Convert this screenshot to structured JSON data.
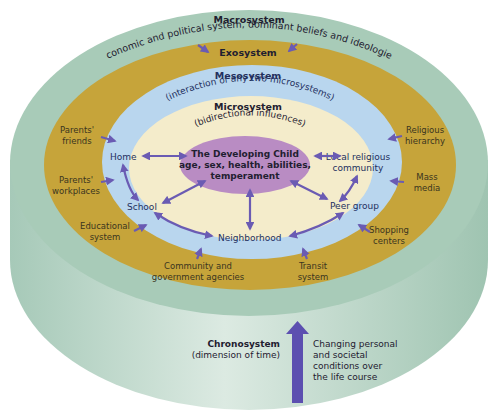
{
  "colors": {
    "macrosystem": "#a8cbb8",
    "cylinder_side": "#b9d6c6",
    "exosystem": "#c6a43a",
    "mesosystem": "#b9d6ee",
    "microsystem": "#f4eccb",
    "child": "#b98cc3",
    "arrow": "#6a5bb3",
    "chrono_arrow": "#5c4fb0"
  },
  "macrosystem": {
    "title": "Macrosystem",
    "description": "Economic and political system, dominant beliefs and ideologies"
  },
  "exosystem": {
    "title": "Exosystem",
    "items": [
      {
        "line1": "Parents'",
        "line2": "friends"
      },
      {
        "line1": "Parents'",
        "line2": "workplaces"
      },
      {
        "line1": "Educational",
        "line2": "system"
      },
      {
        "line1": "Community and",
        "line2": "government agencies"
      },
      {
        "line1": "Transit",
        "line2": "system"
      },
      {
        "line1": "Shopping",
        "line2": "centers"
      },
      {
        "line1": "Mass",
        "line2": "media"
      },
      {
        "line1": "Religious",
        "line2": "hierarchy"
      }
    ]
  },
  "mesosystem": {
    "title": "Mesosystem",
    "description": "(interaction of any two microsystems)"
  },
  "microsystem": {
    "title": "Microsystem",
    "description": "(bidirectional influences)",
    "settings": [
      "Home",
      "School",
      "Neighborhood",
      "Peer group",
      "Local religious",
      "community"
    ]
  },
  "child": {
    "line1": "The Developing Child",
    "line2": "age, sex, health, abilities,",
    "line3": "temperament"
  },
  "chronosystem": {
    "title": "Chronosystem",
    "subtitle": "(dimension of time)",
    "description": [
      "Changing personal",
      "and societal",
      "conditions over",
      "the life course"
    ]
  }
}
